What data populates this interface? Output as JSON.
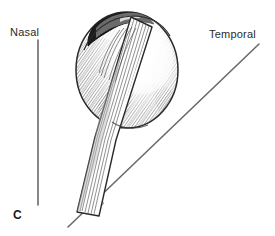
{
  "figure": {
    "panel_letter": "C",
    "caption_labels": {
      "nasal": "Nasal",
      "temporal": "Temporal"
    },
    "angle_mark": "",
    "colors": {
      "ink": "#1a1a1a",
      "line": "#555555",
      "background": "#ffffff",
      "shading_light": "#d8d8d8",
      "shading_mid": "#9a9a9a",
      "shading_dark": "#3a3a3a"
    },
    "elements": [
      {
        "name": "eye-globe",
        "description": "eyeball sphere with stipple shading"
      },
      {
        "name": "dark-limbal-crescent",
        "description": "dark pigmented crescent at superior pole"
      },
      {
        "name": "extraocular-muscle-tendon",
        "description": "striated muscle band crossing globe inferonasally"
      },
      {
        "name": "nasal-axis-line",
        "description": "vertical reference line on nasal side"
      },
      {
        "name": "temporal-axis-line",
        "description": "oblique reference line toward temporal side"
      },
      {
        "name": "angle-tick-mark",
        "description": "small tick annotation on oblique line"
      }
    ]
  }
}
